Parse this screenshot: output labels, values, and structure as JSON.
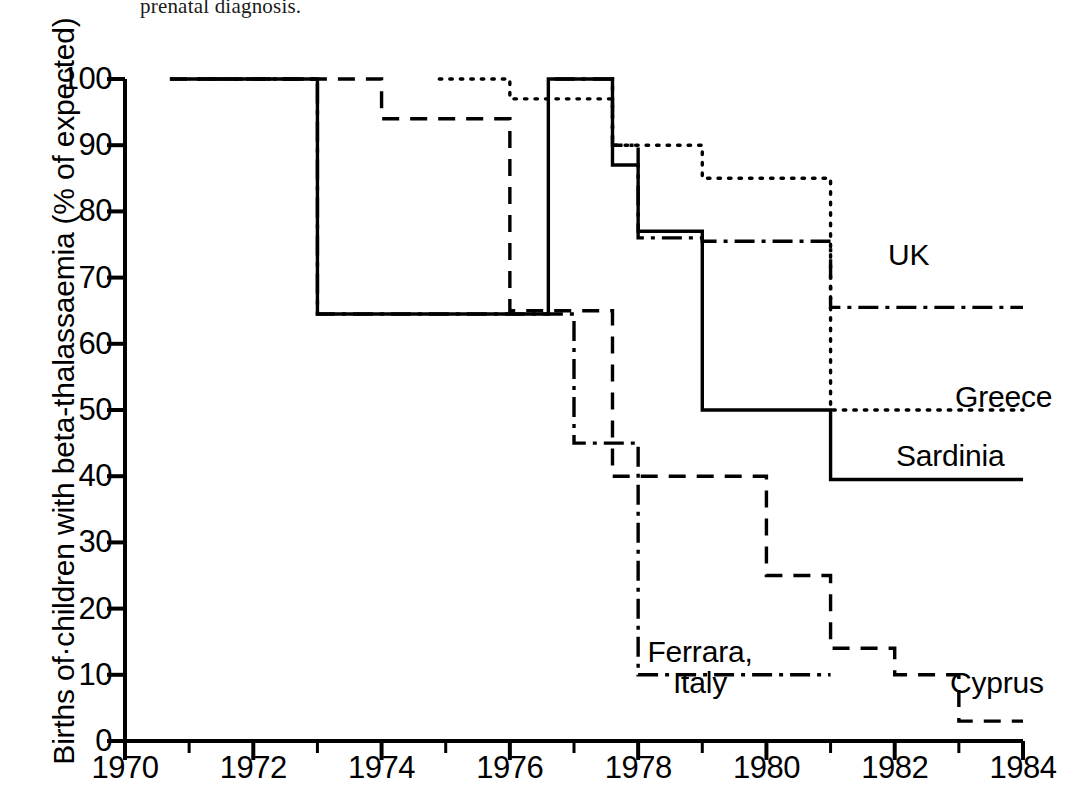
{
  "caption_fragment": "prenatal diagnosis.",
  "axes": {
    "y_title": "Births of·children with beta-thalassaemia (% of expected)",
    "y_ticks": [
      "100",
      "90",
      "80",
      "70",
      "60",
      "50",
      "40",
      "30",
      "20",
      "10",
      "0"
    ],
    "x_ticks": [
      "1970",
      "1972",
      "1974",
      "1976",
      "1978",
      "1980",
      "1982",
      "1984"
    ]
  },
  "labels": {
    "uk": "UK",
    "greece": "Greece",
    "sardinia": "Sardinia",
    "ferrara": "Ferrara,\nItaly",
    "cyprus": "Cyprus"
  },
  "chart_data": {
    "type": "line",
    "subtype": "step",
    "title": "",
    "xlabel": "",
    "ylabel": "Births of children with beta-thalassaemia (% of expected)",
    "xlim": [
      1970,
      1984
    ],
    "ylim": [
      0,
      100
    ],
    "xticks": [
      1970,
      1972,
      1974,
      1976,
      1978,
      1980,
      1982,
      1984
    ],
    "xminorticks": [
      1971,
      1973,
      1975,
      1977,
      1979,
      1981,
      1983
    ],
    "yticks": [
      0,
      10,
      20,
      30,
      40,
      50,
      60,
      70,
      80,
      90,
      100
    ],
    "grid": false,
    "legend": "inline-annotations",
    "line_color": "#000000",
    "series": [
      {
        "name": "Sardinia",
        "linestyle": "solid",
        "dasharray": "",
        "points": [
          {
            "x": 1971.0,
            "y": 100
          },
          {
            "x": 1973.0,
            "y": 100
          },
          {
            "x": 1973.0,
            "y": 64.5
          },
          {
            "x": 1976.6,
            "y": 64.5
          },
          {
            "x": 1976.6,
            "y": 100
          },
          {
            "x": 1977.6,
            "y": 100
          },
          {
            "x": 1977.6,
            "y": 87
          },
          {
            "x": 1978.0,
            "y": 87
          },
          {
            "x": 1978.0,
            "y": 77
          },
          {
            "x": 1979.0,
            "y": 77
          },
          {
            "x": 1979.0,
            "y": 75.5
          },
          {
            "x": 1979.0,
            "y": 50
          },
          {
            "x": 1981.0,
            "y": 50
          },
          {
            "x": 1981.0,
            "y": 39.5
          },
          {
            "x": 1984.0,
            "y": 39.5
          }
        ]
      },
      {
        "name": "Cyprus",
        "linestyle": "dashed",
        "dasharray": "17 11",
        "points": [
          {
            "x": 1970.7,
            "y": 100
          },
          {
            "x": 1974.0,
            "y": 100
          },
          {
            "x": 1974.0,
            "y": 94
          },
          {
            "x": 1976.0,
            "y": 94
          },
          {
            "x": 1976.0,
            "y": 65
          },
          {
            "x": 1977.6,
            "y": 65
          },
          {
            "x": 1977.6,
            "y": 40
          },
          {
            "x": 1980.0,
            "y": 40
          },
          {
            "x": 1980.0,
            "y": 25
          },
          {
            "x": 1981.0,
            "y": 25
          },
          {
            "x": 1981.0,
            "y": 14
          },
          {
            "x": 1982.0,
            "y": 14
          },
          {
            "x": 1982.0,
            "y": 10
          },
          {
            "x": 1983.0,
            "y": 10
          },
          {
            "x": 1983.0,
            "y": 3
          },
          {
            "x": 1984.0,
            "y": 3
          }
        ]
      },
      {
        "name": "UK",
        "linestyle": "dashdot",
        "dasharray": "20 7 4 7",
        "points": [
          {
            "x": 1976.7,
            "y": 100
          },
          {
            "x": 1977.6,
            "y": 100
          },
          {
            "x": 1977.6,
            "y": 90
          },
          {
            "x": 1978.0,
            "y": 90
          },
          {
            "x": 1978.0,
            "y": 76
          },
          {
            "x": 1979.0,
            "y": 76
          },
          {
            "x": 1979.0,
            "y": 75.5
          },
          {
            "x": 1981.0,
            "y": 75.5
          },
          {
            "x": 1981.0,
            "y": 65.5
          },
          {
            "x": 1984.0,
            "y": 65.5
          }
        ]
      },
      {
        "name": "Greece",
        "linestyle": "dotted",
        "dasharray": "2.5 8",
        "points": [
          {
            "x": 1974.9,
            "y": 100
          },
          {
            "x": 1976.0,
            "y": 100
          },
          {
            "x": 1976.0,
            "y": 97
          },
          {
            "x": 1977.6,
            "y": 97
          },
          {
            "x": 1977.6,
            "y": 90
          },
          {
            "x": 1979.0,
            "y": 90
          },
          {
            "x": 1979.0,
            "y": 85
          },
          {
            "x": 1981.0,
            "y": 85
          },
          {
            "x": 1981.0,
            "y": 50
          },
          {
            "x": 1984.0,
            "y": 50
          }
        ]
      },
      {
        "name": "Ferrara, Italy",
        "linestyle": "dashdot",
        "dasharray": "20 7 4 7",
        "points": [
          {
            "x": 1970.7,
            "y": 100
          },
          {
            "x": 1973.0,
            "y": 100
          },
          {
            "x": 1973.0,
            "y": 64.5
          },
          {
            "x": 1977.0,
            "y": 64.5
          },
          {
            "x": 1977.0,
            "y": 45
          },
          {
            "x": 1978.0,
            "y": 45
          },
          {
            "x": 1978.0,
            "y": 10
          },
          {
            "x": 1981.0,
            "y": 10
          }
        ]
      }
    ]
  }
}
